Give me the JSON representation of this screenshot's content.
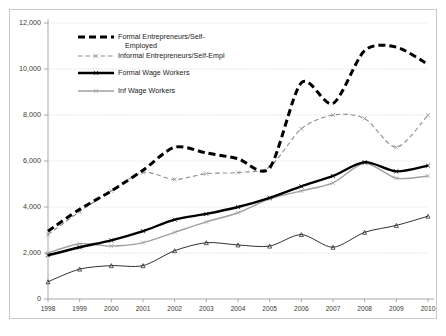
{
  "chart_data": {
    "type": "line",
    "title": "",
    "xlabel": "",
    "ylabel": "",
    "categories": [
      "1998",
      "1999",
      "2000",
      "2001",
      "2002",
      "2003",
      "2004",
      "2005",
      "2006",
      "2007",
      "2008",
      "2009",
      "2010"
    ],
    "ylim": [
      0,
      12000
    ],
    "yticks": [
      0,
      2000,
      4000,
      6000,
      8000,
      10000,
      12000
    ],
    "ytick_labels": [
      "0",
      "2,000",
      "4,000",
      "6,000",
      "8,000",
      "10,000",
      "12,000"
    ],
    "grid": true,
    "legend_position": "upper-left-inside",
    "series": [
      {
        "name": "Formal Entrepreneurs/Self-Employed",
        "style": "thick-dashed",
        "color": "#000000",
        "values": [
          2950,
          3900,
          4700,
          5600,
          6600,
          6350,
          6100,
          5700,
          9400,
          8500,
          10800,
          10950,
          10200
        ]
      },
      {
        "name": "Informal Entrepreneurs/Self-Empl",
        "style": "thin-dashed",
        "color": "#8c8c8c",
        "values": [
          2800,
          3800,
          4700,
          5500,
          5200,
          5450,
          5500,
          5750,
          7400,
          8000,
          7850,
          6600,
          8000
        ]
      },
      {
        "name": "Formal Wage Workers",
        "style": "thick-solid",
        "color": "#000000",
        "values": [
          1900,
          2250,
          2550,
          2950,
          3450,
          3700,
          4000,
          4400,
          4900,
          5350,
          5950,
          5550,
          5800
        ]
      },
      {
        "name": "Inf Wage Workers",
        "style": "thin-solid-gray",
        "color": "#a0a0a0",
        "values": [
          2000,
          2400,
          2300,
          2450,
          2900,
          3350,
          3750,
          4350,
          4700,
          5050,
          5900,
          5250,
          5350
        ]
      },
      {
        "name": "Unlabeled Lower Series",
        "style": "thin-solid-black",
        "color": "#1a1a1a",
        "values": [
          750,
          1300,
          1450,
          1450,
          2100,
          2450,
          2350,
          2300,
          2800,
          2250,
          2900,
          3200,
          3600
        ]
      }
    ]
  },
  "legend": {
    "items": [
      {
        "label_line1": "Formal Entrepreneurs/Self-",
        "label_line2": "Employed",
        "style": "thick-dashed"
      },
      {
        "label_line1": "Informal Entrepreneurs/Self-Empl",
        "label_line2": "",
        "style": "thin-dashed"
      },
      {
        "label_line1": "Formal Wage Workers",
        "label_line2": "",
        "style": "thick-solid"
      },
      {
        "label_line1": "Inf Wage Workers",
        "label_line2": "",
        "style": "thin-solid-gray"
      }
    ]
  },
  "colors": {
    "formal_entrepreneurs": "#000000",
    "informal_entrepreneurs": "#8c8c8c",
    "formal_wage": "#000000",
    "informal_wage": "#a0a0a0",
    "lower_series": "#1a1a1a",
    "grid": "#d9d9d9",
    "axis": "#a8a8a8",
    "frame": "#c9c9c9"
  }
}
